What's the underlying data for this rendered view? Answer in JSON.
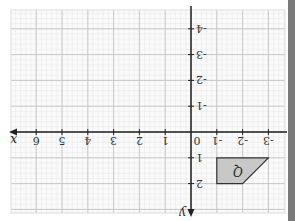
{
  "diagram": {
    "type": "coordinate-grid",
    "orientation": "rotated-180",
    "x_axis": {
      "name": "x",
      "ticks": [
        "-3",
        "-2",
        "-1",
        "0",
        "1",
        "2",
        "3",
        "4",
        "5",
        "6"
      ]
    },
    "y_axis": {
      "name": "y",
      "ticks": [
        "2",
        "1",
        "-1",
        "-2",
        "-3",
        "-4"
      ]
    },
    "shape": {
      "label": "Q",
      "fill": "#c8c8c8",
      "vertices": [
        [
          -3,
          1
        ],
        [
          -1,
          1
        ],
        [
          -1,
          2
        ],
        [
          -2,
          2
        ]
      ]
    },
    "colors": {
      "grid_major": "#c8c8c8",
      "grid_minor": "#e6e6e6",
      "axis": "#222222",
      "edge_bar": "#7a7a7a"
    }
  }
}
